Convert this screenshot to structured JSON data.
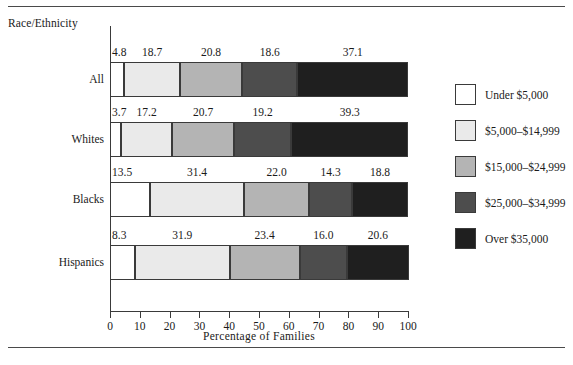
{
  "figure": {
    "y_axis_title": "Race/Ethnicity",
    "x_axis_title": "Percentage of Families"
  },
  "chart_data": {
    "type": "bar",
    "orientation": "horizontal",
    "stacked": true,
    "title": "",
    "xlabel": "Percentage of Families",
    "ylabel": "Race/Ethnicity",
    "xlim": [
      0,
      100
    ],
    "xticks": [
      0,
      10,
      20,
      30,
      40,
      50,
      60,
      70,
      80,
      90,
      100
    ],
    "xtick_labels": [
      "0",
      "10",
      "20",
      "30",
      "40",
      "50",
      "60",
      "70",
      "80",
      "90",
      "100"
    ],
    "grid": false,
    "legend_position": "right",
    "categories": [
      "All",
      "Whites",
      "Blacks",
      "Hispanics"
    ],
    "series": [
      {
        "name": "Under $5,000",
        "color": "#ffffff",
        "values": [
          4.8,
          3.7,
          13.5,
          8.3
        ]
      },
      {
        "name": "$5,000–$14,999",
        "color": "#eaeaea",
        "values": [
          18.7,
          17.2,
          31.4,
          31.9
        ]
      },
      {
        "name": "$15,000–$24,999",
        "color": "#b4b4b4",
        "values": [
          20.8,
          20.7,
          22.0,
          23.4
        ]
      },
      {
        "name": "$25,000–$34,999",
        "color": "#4d4d4d",
        "values": [
          18.6,
          19.2,
          14.3,
          16.0
        ]
      },
      {
        "name": "Over $35,000",
        "color": "#1f1f1f",
        "values": [
          37.1,
          39.3,
          18.8,
          20.6
        ]
      }
    ],
    "value_labels": [
      [
        "4.8",
        "18.7",
        "20.8",
        "18.6",
        "37.1"
      ],
      [
        "3.7",
        "17.2",
        "20.7",
        "19.2",
        "39.3"
      ],
      [
        "13.5",
        "31.4",
        "22.0",
        "14.3",
        "18.8"
      ],
      [
        "8.3",
        "31.9",
        "23.4",
        "16.0",
        "20.6"
      ]
    ]
  },
  "legend": {
    "items": [
      {
        "label": "Under $5,000",
        "color": "#ffffff"
      },
      {
        "label": "$5,000–$14,999",
        "color": "#eaeaea"
      },
      {
        "label": "$15,000–$24,999",
        "color": "#b4b4b4"
      },
      {
        "label": "$25,000–$34,999",
        "color": "#4d4d4d"
      },
      {
        "label": "Over $35,000",
        "color": "#1f1f1f"
      }
    ]
  }
}
